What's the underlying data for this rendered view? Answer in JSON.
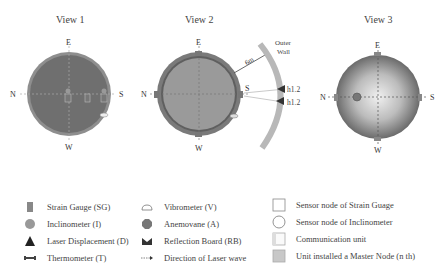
{
  "views": [
    {
      "title": "View 1",
      "directions": {
        "top": "E",
        "bottom": "W",
        "left": "N",
        "right": "S"
      }
    },
    {
      "title": "View 2",
      "directions": {
        "top": "E",
        "bottom": "W",
        "left": "N",
        "right": "S"
      },
      "annotations": {
        "distance": "6m",
        "outer_wall": "Outer Wall",
        "height_1": "h1.2",
        "height_2": "h1.2"
      }
    },
    {
      "title": "View 3",
      "directions": {
        "top": "E",
        "bottom": "W",
        "left": "N",
        "right": "S"
      }
    }
  ],
  "legend": {
    "col1": [
      {
        "icon": "strain-gauge-icon",
        "label": "Strain Gauge (SG)"
      },
      {
        "icon": "inclinometer-icon",
        "label": "Inclinometer (I)"
      },
      {
        "icon": "laser-displacement-icon",
        "label": "Laser Displacement (D)"
      },
      {
        "icon": "thermometer-icon",
        "label": "Thermometer (T)"
      }
    ],
    "col2": [
      {
        "icon": "vibrometer-icon",
        "label": "Vibrometer (V)"
      },
      {
        "icon": "anemovane-icon",
        "label": "Anemovane (A)"
      },
      {
        "icon": "reflection-board-icon",
        "label": "Reflection Board (RB)"
      },
      {
        "icon": "laser-direction-icon",
        "label": "Direction of Laser wave"
      }
    ],
    "col3": [
      {
        "icon": "sg-sensor-node-icon",
        "label": "Sensor node of Strain Guage"
      },
      {
        "icon": "inclinometer-sensor-node-icon",
        "label": "Sensor node of Inclinometer"
      },
      {
        "icon": "communication-unit-icon",
        "label": "Communication unit"
      },
      {
        "icon": "master-node-icon",
        "label": "Unit installed a Master Node (n th)"
      }
    ]
  },
  "colors": {
    "disc_dark": "#6e6e6e",
    "disc_mid": "#8a8a8a",
    "disc_light": "#b4b4b4",
    "wall": "#b8b8b8",
    "text": "#444444"
  }
}
